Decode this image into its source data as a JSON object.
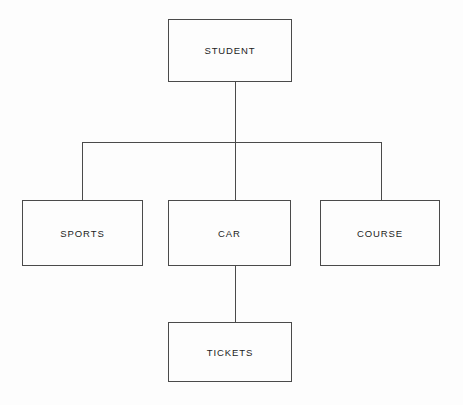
{
  "diagram": {
    "type": "hierarchy-tree",
    "title": "",
    "background_color": "#fdfdfd",
    "line_color": "#4a4a4a",
    "text_color": "#1c1c1c",
    "nodes": [
      {
        "id": "student",
        "label": "STUDENT",
        "level": 0
      },
      {
        "id": "sports",
        "label": "SPORTS",
        "level": 1
      },
      {
        "id": "car",
        "label": "CAR",
        "level": 1
      },
      {
        "id": "course",
        "label": "COURSE",
        "level": 1
      },
      {
        "id": "tickets",
        "label": "TICKETS",
        "level": 2
      }
    ],
    "edges": [
      {
        "from": "student",
        "to": "sports"
      },
      {
        "from": "student",
        "to": "car"
      },
      {
        "from": "student",
        "to": "course"
      },
      {
        "from": "car",
        "to": "tickets"
      }
    ]
  }
}
